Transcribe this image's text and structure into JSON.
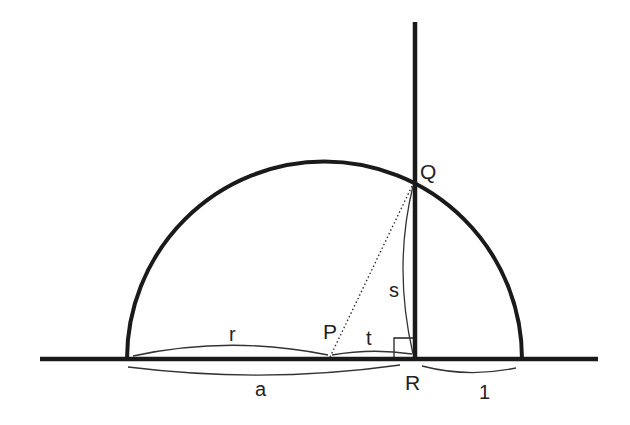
{
  "diagram": {
    "type": "geometry",
    "colors": {
      "stroke": "#1a1a1a",
      "thin": "#333333",
      "background": "#ffffff"
    },
    "labels": {
      "Q": "Q",
      "P": "P",
      "R": "R",
      "r": "r",
      "t": "t",
      "s": "s",
      "a": "a",
      "one": "1"
    },
    "elements": {
      "baseline": {
        "x1": 40,
        "y1": 359,
        "x2": 598,
        "y2": 359
      },
      "semicircle": {
        "cx": 324.5,
        "cy": 359,
        "r": 197.5
      },
      "perpendicular": {
        "x1": 415,
        "y1": 22,
        "x2": 415,
        "y2": 359
      },
      "points": {
        "P": {
          "x": 330,
          "y": 357
        },
        "Q": {
          "x": 415,
          "y": 182
        },
        "R": {
          "x": 415,
          "y": 359
        }
      },
      "segments": [
        {
          "name": "r",
          "from": "left-end",
          "to": "P"
        },
        {
          "name": "t",
          "from": "P",
          "to": "R"
        },
        {
          "name": "s",
          "from": "R",
          "to": "Q"
        },
        {
          "name": "a",
          "from": "left-end",
          "to": "R"
        },
        {
          "name": "1",
          "from": "R",
          "to": "right-end"
        }
      ],
      "right_angle_marker": {
        "at": "R"
      },
      "dotted_line": {
        "from": "P",
        "to": "Q"
      }
    }
  }
}
